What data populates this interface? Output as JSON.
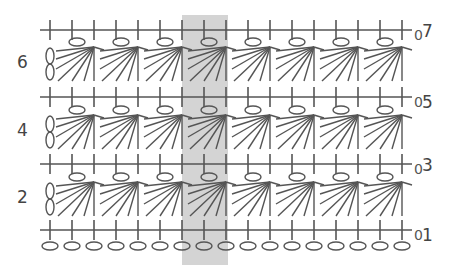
{
  "diagram": {
    "type": "crochet-stitch-chart",
    "colors": {
      "stroke": "#555555",
      "highlight": "#d4d4d4",
      "label": "#444444"
    },
    "grid": {
      "first_stitch_x": 50,
      "stitch_spacing": 22,
      "stitch_count": 17,
      "repeat_width_stitches": 2
    },
    "highlight_column": {
      "x": 182,
      "y": 15,
      "width": 46,
      "height": 250
    },
    "rows": [
      {
        "number": "7",
        "kind": "single-crochet",
        "label_side": "right",
        "y": 30,
        "turning_chain": "0"
      },
      {
        "number": "6",
        "kind": "fan",
        "label_side": "left",
        "y": 63
      },
      {
        "number": "5",
        "kind": "single-crochet",
        "label_side": "right",
        "y": 97,
        "turning_chain": "0"
      },
      {
        "number": "4",
        "kind": "fan",
        "label_side": "left",
        "y": 131
      },
      {
        "number": "3",
        "kind": "single-crochet",
        "label_side": "right",
        "y": 164,
        "turning_chain": "0"
      },
      {
        "number": "2",
        "kind": "fan",
        "label_side": "left",
        "y": 198
      },
      {
        "number": "1",
        "kind": "single-crochet",
        "label_side": "right",
        "y": 230,
        "turning_chain": "0"
      },
      {
        "number": "",
        "kind": "foundation-chain",
        "label_side": "none",
        "y": 246
      }
    ],
    "labels": {
      "r7": "7",
      "r6": "6",
      "r5": "5",
      "r4": "4",
      "r3": "3",
      "r2": "2",
      "r1": "1",
      "turn": "0"
    },
    "legend_symbols": {
      "cross": "single crochet",
      "oval": "chain stitch",
      "fan": "fan / cluster stitch",
      "double-oval": "turning chain (2 ch)"
    }
  }
}
